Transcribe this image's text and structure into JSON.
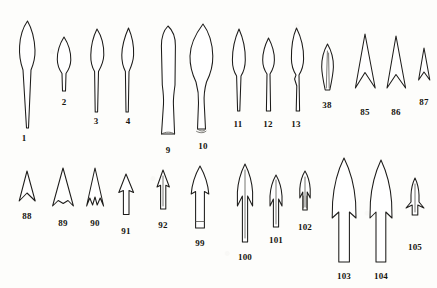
{
  "plate": {
    "background_color": "#fdfdfb",
    "ink_color": "#1d1c1a",
    "width": 437,
    "height": 288,
    "kind": "archaeological-typology-plate",
    "description": "Line drawings of prehistoric metal spearheads, javelin heads and arrowheads arranged in two rows with catalogue numbers beneath each item."
  },
  "artifacts": [
    {
      "id": "1",
      "label": "1",
      "label_x": 24,
      "label_y": 134,
      "type": "leaf-shaped-blade-long-tang"
    },
    {
      "id": "2",
      "label": "2",
      "label_x": 64,
      "label_y": 98,
      "type": "leaf-shaped-blade-short-tang"
    },
    {
      "id": "3",
      "label": "3",
      "label_x": 96,
      "label_y": 117,
      "type": "leaf-blade-narrow-tang"
    },
    {
      "id": "4",
      "label": "4",
      "label_x": 128,
      "label_y": 117,
      "type": "slender-blade-narrow-tang"
    },
    {
      "id": "9",
      "label": "9",
      "label_x": 168,
      "label_y": 146,
      "type": "socketed-blade-flared-base"
    },
    {
      "id": "10",
      "label": "10",
      "label_x": 203,
      "label_y": 142,
      "type": "socketed-spearhead-collared-base"
    },
    {
      "id": "11",
      "label": "11",
      "label_x": 238,
      "label_y": 120,
      "type": "lozenge-point-long-tang"
    },
    {
      "id": "12",
      "label": "12",
      "label_x": 268,
      "label_y": 120,
      "type": "rhomboid-point-short-tang"
    },
    {
      "id": "13",
      "label": "13",
      "label_x": 296,
      "label_y": 120,
      "type": "lozenge-point-tanged"
    },
    {
      "id": "38",
      "label": "38",
      "label_x": 327,
      "label_y": 101,
      "type": "leaf-arrowhead-midrib"
    },
    {
      "id": "85",
      "label": "85",
      "label_x": 365,
      "label_y": 108,
      "type": "hollow-based-triangular-arrowhead"
    },
    {
      "id": "86",
      "label": "86",
      "label_x": 396,
      "label_y": 108,
      "type": "hollow-based-triangular-arrowhead"
    },
    {
      "id": "87",
      "label": "87",
      "label_x": 424,
      "label_y": 98,
      "type": "small-hollow-based-arrowhead"
    },
    {
      "id": "88",
      "label": "88",
      "label_x": 27,
      "label_y": 212,
      "type": "small-concave-based-arrowhead"
    },
    {
      "id": "89",
      "label": "89",
      "label_x": 63,
      "label_y": 219,
      "type": "concave-based-barbed-arrowhead"
    },
    {
      "id": "90",
      "label": "90",
      "label_x": 95,
      "label_y": 219,
      "type": "trifid-based-arrowhead"
    },
    {
      "id": "91",
      "label": "91",
      "label_x": 126,
      "label_y": 227,
      "type": "tanged-triangular-arrowhead"
    },
    {
      "id": "92",
      "label": "92",
      "label_x": 163,
      "label_y": 221,
      "type": "tanged-arrowhead-narrow"
    },
    {
      "id": "99",
      "label": "99",
      "label_x": 200,
      "label_y": 239,
      "type": "tanged-arrowhead-broad-stem"
    },
    {
      "id": "100",
      "label": "100",
      "label_x": 245,
      "label_y": 253,
      "type": "barbed-and-tanged-arrowhead-large"
    },
    {
      "id": "101",
      "label": "101",
      "label_x": 276,
      "label_y": 236,
      "type": "barbed-and-tanged-arrowhead"
    },
    {
      "id": "102",
      "label": "102",
      "label_x": 305,
      "label_y": 223,
      "type": "small-barbed-arrowhead"
    },
    {
      "id": "103",
      "label": "103",
      "label_x": 344,
      "label_y": 272,
      "type": "large-tanged-barbed-point"
    },
    {
      "id": "104",
      "label": "104",
      "label_x": 381,
      "label_y": 272,
      "type": "large-tanged-barbed-point"
    },
    {
      "id": "105",
      "label": "105",
      "label_x": 415,
      "label_y": 243,
      "type": "small-splayed-barb-arrowhead"
    }
  ]
}
